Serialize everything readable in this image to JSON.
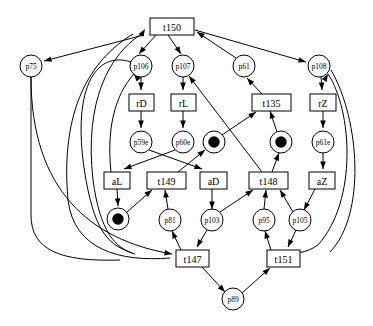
{
  "diagram": {
    "type": "petri-net",
    "colors": {
      "stroke": "#000000",
      "fill": "#ffffff",
      "token": "#000000"
    },
    "places": [
      {
        "id": "p75",
        "label": "p75",
        "x": 31,
        "y": 66,
        "r": 11,
        "tokens": 0
      },
      {
        "id": "p106",
        "label": "p106",
        "x": 141,
        "y": 66,
        "r": 11,
        "tokens": 0
      },
      {
        "id": "p107",
        "label": "p107",
        "x": 183,
        "y": 66,
        "r": 11,
        "tokens": 0
      },
      {
        "id": "p61",
        "label": "p61",
        "x": 244,
        "y": 66,
        "r": 11,
        "tokens": 0
      },
      {
        "id": "p108",
        "label": "p108",
        "x": 319,
        "y": 66,
        "r": 11,
        "tokens": 0
      },
      {
        "id": "p59e",
        "label": "p59e",
        "x": 141,
        "y": 142,
        "r": 11,
        "tokens": 0
      },
      {
        "id": "p60e",
        "label": "p60e",
        "x": 183,
        "y": 142,
        "r": 11,
        "tokens": 0
      },
      {
        "id": "pA",
        "label": "",
        "x": 214,
        "y": 142,
        "r": 11,
        "tokens": 1
      },
      {
        "id": "pB",
        "label": "",
        "x": 281,
        "y": 142,
        "r": 11,
        "tokens": 1
      },
      {
        "id": "p61e",
        "label": "p61e",
        "x": 323,
        "y": 142,
        "r": 11,
        "tokens": 0
      },
      {
        "id": "pC",
        "label": "",
        "x": 118,
        "y": 219,
        "r": 11,
        "tokens": 1
      },
      {
        "id": "p81",
        "label": "p81",
        "x": 170,
        "y": 220,
        "r": 11,
        "tokens": 0
      },
      {
        "id": "p103",
        "label": "p103",
        "x": 212,
        "y": 220,
        "r": 11,
        "tokens": 0
      },
      {
        "id": "p95",
        "label": "p95",
        "x": 264,
        "y": 220,
        "r": 11,
        "tokens": 0
      },
      {
        "id": "p105",
        "label": "p105",
        "x": 300,
        "y": 220,
        "r": 11,
        "tokens": 0
      },
      {
        "id": "p89",
        "label": "p89",
        "x": 233,
        "y": 299,
        "r": 11,
        "tokens": 0
      }
    ],
    "transitions": [
      {
        "id": "t150",
        "label": "t150",
        "x": 150,
        "y": 18,
        "w": 44,
        "h": 17
      },
      {
        "id": "rD",
        "label": "rD",
        "x": 129,
        "y": 94,
        "w": 25,
        "h": 17
      },
      {
        "id": "rL",
        "label": "rL",
        "x": 171,
        "y": 94,
        "w": 25,
        "h": 17
      },
      {
        "id": "t135",
        "label": "t135",
        "x": 252,
        "y": 94,
        "w": 39,
        "h": 17
      },
      {
        "id": "rZ",
        "label": "rZ",
        "x": 310,
        "y": 94,
        "w": 26,
        "h": 17
      },
      {
        "id": "aL",
        "label": "aL",
        "x": 104,
        "y": 172,
        "w": 26,
        "h": 17
      },
      {
        "id": "t149",
        "label": "t149",
        "x": 147,
        "y": 172,
        "w": 39,
        "h": 17
      },
      {
        "id": "aD",
        "label": "aD",
        "x": 200,
        "y": 172,
        "w": 27,
        "h": 17
      },
      {
        "id": "t148",
        "label": "t148",
        "x": 249,
        "y": 172,
        "w": 39,
        "h": 17
      },
      {
        "id": "aZ",
        "label": "aZ",
        "x": 309,
        "y": 172,
        "w": 26,
        "h": 17
      },
      {
        "id": "t147",
        "label": "t147",
        "x": 176,
        "y": 250,
        "w": 33,
        "h": 17
      },
      {
        "id": "t151",
        "label": "t151",
        "x": 267,
        "y": 250,
        "w": 33,
        "h": 17
      }
    ],
    "arcs": [
      {
        "from": "t150",
        "to": "p75",
        "path": "M 144 35 L 44 61",
        "arrow": [
          44,
          61,
          -21,
          5.5
        ]
      },
      {
        "from": "t150",
        "to": "p106",
        "path": "M 156 35 L 139 54",
        "arrow": [
          139,
          54,
          -3.5,
          4.2
        ]
      },
      {
        "from": "t150",
        "to": "p107",
        "path": "M 168 35 L 181 54",
        "arrow": [
          181,
          54,
          2.8,
          4.4
        ]
      },
      {
        "from": "p61",
        "to": "t150",
        "path": "M 236 58 L 197 32",
        "arrow": [
          197,
          32,
          -8.4,
          -5.6
        ]
      },
      {
        "from": "t150",
        "to": "p108",
        "path": "M 195 30 L 306 62",
        "arrow": [
          306,
          62,
          23,
          6.6
        ]
      },
      {
        "from": "p106",
        "to": "rD",
        "path": "M 141 77 L 141 90",
        "arrow": [
          141,
          90,
          0,
          3.6
        ]
      },
      {
        "from": "p107",
        "to": "rL",
        "path": "M 183 77 L 183 90",
        "arrow": [
          183,
          90,
          0,
          3.6
        ]
      },
      {
        "from": "t135",
        "to": "p61",
        "path": "M 262 94 L 247 78",
        "arrow": [
          247,
          78,
          -3.2,
          -3.5
        ]
      },
      {
        "from": "p108",
        "to": "rZ",
        "path": "M 321 77 L 322 90",
        "arrow": [
          322,
          90,
          0.2,
          3.6
        ]
      },
      {
        "from": "rD",
        "to": "p59e",
        "path": "M 141 111 L 141 128",
        "arrow": [
          141,
          128,
          0,
          3.6
        ]
      },
      {
        "from": "rL",
        "to": "p60e",
        "path": "M 183 111 L 183 128",
        "arrow": [
          183,
          128,
          0,
          3.6
        ]
      },
      {
        "from": "rZ",
        "to": "p61e",
        "path": "M 323 111 L 323 128",
        "arrow": [
          323,
          128,
          0,
          3.6
        ]
      },
      {
        "from": "p59e",
        "to": "aD",
        "path": "M 149 150 L 202 169",
        "arrow": [
          202,
          169,
          11,
          4
        ]
      },
      {
        "from": "p60e",
        "to": "aL",
        "path": "M 175 150 L 124 169",
        "arrow": [
          124,
          169,
          -11,
          4
        ]
      },
      {
        "from": "t149",
        "to": "pA",
        "path": "M 178 172 L 205 150",
        "arrow": [
          205,
          150,
          5.2,
          -4.2
        ]
      },
      {
        "from": "pA",
        "to": "t135",
        "path": "M 222 135 L 256 112",
        "arrow": [
          256,
          112,
          6.6,
          -4.5
        ]
      },
      {
        "from": "pB",
        "to": "t135",
        "path": "M 277 132 L 270 111",
        "arrow": [
          270,
          111,
          -1.6,
          -4.6
        ]
      },
      {
        "from": "t148",
        "to": "pB",
        "path": "M 272 172 L 279 153",
        "arrow": [
          279,
          153,
          1.6,
          -4.2
        ]
      },
      {
        "from": "t148",
        "to": "p107",
        "path": "M 262 172 L 189 76",
        "arrow": [
          189,
          76,
          -5.5,
          -7.2
        ]
      },
      {
        "from": "p61e",
        "to": "aZ",
        "path": "M 323 153 L 323 169",
        "arrow": [
          323,
          169,
          0,
          3.6
        ]
      },
      {
        "from": "aL",
        "to": "pC",
        "path": "M 117 189 L 118 206",
        "arrow": [
          118,
          206,
          0.2,
          3.6
        ]
      },
      {
        "from": "pC",
        "to": "t149",
        "path": "M 127 212 L 152 190",
        "arrow": [
          152,
          190,
          5.4,
          -4.4
        ]
      },
      {
        "from": "p81",
        "to": "t149",
        "path": "M 168 209 L 165 190",
        "arrow": [
          165,
          190,
          -0.7,
          -4.5
        ]
      },
      {
        "from": "aD",
        "to": "p103",
        "path": "M 212 189 L 212 209",
        "arrow": [
          212,
          209,
          0,
          3.6
        ]
      },
      {
        "from": "p103",
        "to": "t148",
        "path": "M 220 212 L 253 190",
        "arrow": [
          253,
          190,
          6.6,
          -4.4
        ]
      },
      {
        "from": "p95",
        "to": "t148",
        "path": "M 264 209 L 266 190",
        "arrow": [
          266,
          190,
          0.5,
          -4.5
        ]
      },
      {
        "from": "p105",
        "to": "t148",
        "path": "M 293 212 L 280 190",
        "arrow": [
          280,
          190,
          -2.8,
          -4.6
        ]
      },
      {
        "from": "aZ",
        "to": "p105",
        "path": "M 315 189 L 304 210",
        "arrow": [
          304,
          210,
          -2.3,
          4.5
        ]
      },
      {
        "from": "t147",
        "to": "p81",
        "path": "M 181 250 L 172 231",
        "arrow": [
          172,
          231,
          -2,
          -4.4
        ]
      },
      {
        "from": "p103",
        "to": "t147",
        "path": "M 207 230 L 197 247",
        "arrow": [
          197,
          247,
          -2.3,
          4.3
        ]
      },
      {
        "from": "t151",
        "to": "p95",
        "path": "M 271 250 L 265 231",
        "arrow": [
          265,
          231,
          -1.4,
          -4.6
        ]
      },
      {
        "from": "p105",
        "to": "t151",
        "path": "M 296 230 L 288 247",
        "arrow": [
          288,
          247,
          -1.9,
          4.4
        ]
      },
      {
        "from": "t147",
        "to": "p89",
        "path": "M 202 267 L 225 292",
        "arrow": [
          225,
          292,
          5,
          5.4
        ]
      },
      {
        "from": "p89",
        "to": "t151",
        "path": "M 242 293 L 270 268",
        "arrow": [
          270,
          268,
          5.6,
          -5
        ]
      },
      {
        "from": "p75",
        "to": "t147",
        "path": "M 31 77 C 31 190 90 240 172 254",
        "arrow": [
          172,
          254,
          10,
          1.7
        ]
      },
      {
        "from": "p106",
        "to": "t150",
        "path": "M 131 62 C 95 50 70 90 86 180 C 96 235 110 245 132 253",
        "arrow": [
          145,
          29,
          5,
          -8
        ],
        "reverse": true
      },
      {
        "from": "t150",
        "to": "loop-left-1",
        "path": "M 133 34 C 90 60 60 110 68 200 C 74 250 120 262 170 258",
        "arrow": null
      },
      {
        "from": "t150",
        "to": "loop-left-2",
        "path": "M 140 35 C 110 55 84 100 93 180 C 100 232 115 248 135 254",
        "arrow": null
      },
      {
        "from": "p106",
        "to": "arc-up-left",
        "path": "M 134 74 C 115 95 105 130 112 180",
        "arrow": [
          134,
          74,
          -4.5,
          -5.5
        ]
      },
      {
        "from": "p108",
        "to": "t151-loop",
        "path": "M 328 74 C 352 110 358 200 318 245 C 305 254 295 253 290 252",
        "arrow": [
          328,
          74,
          3.2,
          -5.5
        ]
      },
      {
        "from": "p108",
        "to": "right-down",
        "path": "M 331 70 C 360 120 366 215 330 252",
        "arrow": null
      },
      {
        "from": "p75",
        "to": "down-left",
        "path": "M 31 77 L 31 215 C 31 250 60 262 120 260",
        "arrow": null
      }
    ]
  }
}
